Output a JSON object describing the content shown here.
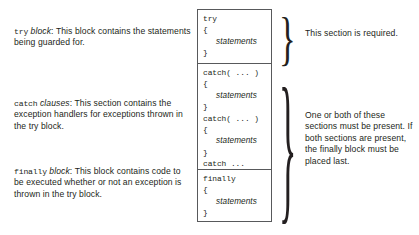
{
  "diagram": {
    "text_color": "#231f20",
    "border_color": "#58595b",
    "background": "#ffffff"
  },
  "descriptions": [
    {
      "keyword": "try",
      "emphasis": "block",
      "separator": ": ",
      "body": "This block contains the statements being guarded for."
    },
    {
      "keyword": "catch",
      "emphasis": "clauses",
      "separator": ": ",
      "body": "This section contains the exception handlers for exceptions thrown in the try block."
    },
    {
      "keyword": "finally",
      "emphasis": "block",
      "separator": ": ",
      "body": "This block contains code to be executed whether or not an exception is thrown in the try block."
    }
  ],
  "code_box": {
    "sections": [
      {
        "name": "try-section",
        "lines": [
          {
            "text": "try",
            "style": "code"
          },
          {
            "text": "{",
            "style": "code"
          },
          {
            "text": "statements",
            "style": "italic"
          },
          {
            "text": "}",
            "style": "code"
          }
        ]
      },
      {
        "name": "catch-section",
        "lines": [
          {
            "text": "catch( ... )",
            "style": "code"
          },
          {
            "text": "{",
            "style": "code"
          },
          {
            "text": "statements",
            "style": "italic"
          },
          {
            "text": "}",
            "style": "code"
          },
          {
            "text": "catch( ... )",
            "style": "code"
          },
          {
            "text": "{",
            "style": "code"
          },
          {
            "text": "statements",
            "style": "italic"
          },
          {
            "text": "}",
            "style": "code"
          },
          {
            "text": "catch ...",
            "style": "code"
          }
        ]
      },
      {
        "name": "finally-section",
        "lines": [
          {
            "text": "finally",
            "style": "code"
          },
          {
            "text": "{",
            "style": "code"
          },
          {
            "text": "statements",
            "style": "italic"
          },
          {
            "text": "}",
            "style": "code"
          }
        ]
      }
    ]
  },
  "braces": {
    "top": "}",
    "bottom": "}"
  },
  "notes": [
    {
      "name": "required-note",
      "text": "This section is required."
    },
    {
      "name": "optional-note",
      "text": "One or both of these sections must be present. If both sections are present, the finally block must be placed last."
    }
  ]
}
